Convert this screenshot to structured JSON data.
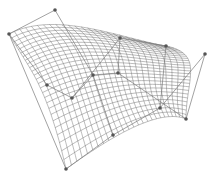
{
  "diagram": {
    "type": "bezier-surface-control-mesh",
    "background": "#ffffff",
    "mesh_color": "#6e6e6e",
    "control_color": "#555555",
    "grid_resolution": {
      "u": 26,
      "v": 26
    },
    "control_points": [
      [
        [
          9,
          34
        ],
        [
          55,
          10
        ],
        [
          120,
          38
        ],
        [
          166,
          46
        ]
      ],
      [
        [
          47,
          85
        ],
        [
          93,
          75
        ],
        [
          118,
          73
        ],
        [
          205,
          54
        ]
      ],
      [
        [
          72,
          98
        ],
        [
          113,
          135
        ],
        [
          160,
          108
        ],
        [
          186,
          119
        ]
      ],
      [
        [
          66,
          169
        ],
        [
          113,
          135
        ],
        [
          160,
          108
        ],
        [
          186,
          119
        ]
      ]
    ]
  }
}
